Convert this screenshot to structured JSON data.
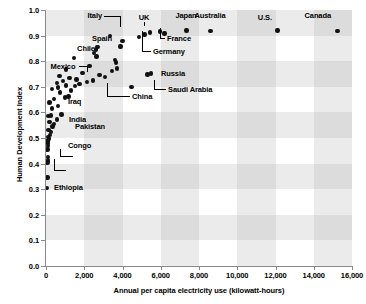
{
  "chart_data": {
    "type": "scatter",
    "title": "",
    "xlabel": "Annual per capita electricity use (kilowatt-hours)",
    "ylabel": "Human Development Index",
    "xlim": [
      0,
      16000
    ],
    "ylim": [
      0.0,
      1.0
    ],
    "xticks": [
      0,
      2000,
      4000,
      6000,
      8000,
      10000,
      12000,
      14000,
      16000
    ],
    "xtick_labels": [
      "0",
      "2,000",
      "4,000",
      "6,000",
      "8,000",
      "10,000",
      "12,000",
      "14,000",
      "16,000"
    ],
    "yticks": [
      0.0,
      0.1,
      0.2,
      0.3,
      0.4,
      0.5,
      0.6,
      0.7,
      0.8,
      0.9,
      1.0
    ],
    "ytick_labels": [
      "0.0",
      "0.1",
      "0.2",
      "0.3",
      "0.4",
      "0.5",
      "0.6",
      "0.7",
      "0.8",
      "0.9",
      "1.0"
    ],
    "grid": "checkerboard-bands",
    "legend": "none",
    "marker_color": "#111111",
    "band_color": "#e8e8e8",
    "points": [
      {
        "x": 60,
        "y": 0.305
      },
      {
        "x": 70,
        "y": 0.345
      },
      {
        "x": 75,
        "y": 0.405
      },
      {
        "x": 90,
        "y": 0.412
      },
      {
        "x": 100,
        "y": 0.425
      },
      {
        "x": 80,
        "y": 0.455
      },
      {
        "x": 95,
        "y": 0.468
      },
      {
        "x": 110,
        "y": 0.478
      },
      {
        "x": 70,
        "y": 0.487
      },
      {
        "x": 120,
        "y": 0.492
      },
      {
        "x": 150,
        "y": 0.498
      },
      {
        "x": 90,
        "y": 0.505
      },
      {
        "x": 200,
        "y": 0.512
      },
      {
        "x": 260,
        "y": 0.523
      },
      {
        "x": 140,
        "y": 0.532
      },
      {
        "x": 330,
        "y": 0.545
      },
      {
        "x": 420,
        "y": 0.555
      },
      {
        "x": 190,
        "y": 0.562
      },
      {
        "x": 560,
        "y": 0.572
      },
      {
        "x": 130,
        "y": 0.585
      },
      {
        "x": 260,
        "y": 0.588
      },
      {
        "x": 820,
        "y": 0.592
      },
      {
        "x": 310,
        "y": 0.615
      },
      {
        "x": 640,
        "y": 0.625
      },
      {
        "x": 180,
        "y": 0.638
      },
      {
        "x": 420,
        "y": 0.652
      },
      {
        "x": 980,
        "y": 0.658
      },
      {
        "x": 1180,
        "y": 0.662
      },
      {
        "x": 740,
        "y": 0.678
      },
      {
        "x": 1320,
        "y": 0.685
      },
      {
        "x": 300,
        "y": 0.692
      },
      {
        "x": 640,
        "y": 0.698
      },
      {
        "x": 1500,
        "y": 0.702
      },
      {
        "x": 1040,
        "y": 0.705
      },
      {
        "x": 1760,
        "y": 0.712
      },
      {
        "x": 560,
        "y": 0.715
      },
      {
        "x": 2150,
        "y": 0.718
      },
      {
        "x": 880,
        "y": 0.722
      },
      {
        "x": 2460,
        "y": 0.725
      },
      {
        "x": 1600,
        "y": 0.728
      },
      {
        "x": 4480,
        "y": 0.7
      },
      {
        "x": 1220,
        "y": 0.735
      },
      {
        "x": 3100,
        "y": 0.738
      },
      {
        "x": 700,
        "y": 0.742
      },
      {
        "x": 2800,
        "y": 0.745
      },
      {
        "x": 5300,
        "y": 0.748
      },
      {
        "x": 5500,
        "y": 0.752
      },
      {
        "x": 1900,
        "y": 0.755
      },
      {
        "x": 3450,
        "y": 0.762
      },
      {
        "x": 1050,
        "y": 0.768
      },
      {
        "x": 3700,
        "y": 0.772
      },
      {
        "x": 2280,
        "y": 0.782
      },
      {
        "x": 3660,
        "y": 0.795
      },
      {
        "x": 3620,
        "y": 0.805
      },
      {
        "x": 1450,
        "y": 0.812
      },
      {
        "x": 2650,
        "y": 0.818
      },
      {
        "x": 2500,
        "y": 0.832
      },
      {
        "x": 2620,
        "y": 0.845
      },
      {
        "x": 2700,
        "y": 0.855
      },
      {
        "x": 3900,
        "y": 0.858
      },
      {
        "x": 4000,
        "y": 0.878
      },
      {
        "x": 4850,
        "y": 0.895
      },
      {
        "x": 3360,
        "y": 0.898
      },
      {
        "x": 5150,
        "y": 0.905
      },
      {
        "x": 5450,
        "y": 0.912
      },
      {
        "x": 5950,
        "y": 0.916
      },
      {
        "x": 6200,
        "y": 0.908
      },
      {
        "x": 7350,
        "y": 0.92
      },
      {
        "x": 8600,
        "y": 0.918
      },
      {
        "x": 12100,
        "y": 0.92
      },
      {
        "x": 15250,
        "y": 0.918
      }
    ],
    "annotations": [
      {
        "label": "Italy",
        "point": {
          "x": 4000,
          "y": 0.878
        }
      },
      {
        "label": "UK",
        "point": {
          "x": 5450,
          "y": 0.912
        }
      },
      {
        "label": "Japan",
        "point": {
          "x": 7350,
          "y": 0.92
        }
      },
      {
        "label": "Australia",
        "point": {
          "x": 8600,
          "y": 0.918
        }
      },
      {
        "label": "U.S.",
        "point": {
          "x": 12100,
          "y": 0.92
        }
      },
      {
        "label": "Canada",
        "point": {
          "x": 15250,
          "y": 0.918
        }
      },
      {
        "label": "France",
        "point": {
          "x": 5950,
          "y": 0.916
        }
      },
      {
        "label": "Germany",
        "point": {
          "x": 6200,
          "y": 0.908
        }
      },
      {
        "label": "Spain",
        "point": {
          "x": 3360,
          "y": 0.898
        }
      },
      {
        "label": "Chile",
        "point": {
          "x": 2700,
          "y": 0.855
        }
      },
      {
        "label": "Mexico",
        "point": {
          "x": 1450,
          "y": 0.812
        }
      },
      {
        "label": "Russia",
        "point": {
          "x": 5300,
          "y": 0.748
        }
      },
      {
        "label": "Saudi Arabia",
        "point": {
          "x": 5500,
          "y": 0.752
        }
      },
      {
        "label": "China",
        "point": {
          "x": 1760,
          "y": 0.712
        }
      },
      {
        "label": "Iraq",
        "point": {
          "x": 980,
          "y": 0.658
        }
      },
      {
        "label": "India",
        "point": {
          "x": 560,
          "y": 0.572
        }
      },
      {
        "label": "Pakistan",
        "point": {
          "x": 420,
          "y": 0.555
        }
      },
      {
        "label": "Congo",
        "point": {
          "x": 95,
          "y": 0.468
        }
      },
      {
        "label": "Ethiopia",
        "point": {
          "x": 60,
          "y": 0.305
        }
      }
    ]
  },
  "labels": {
    "italy": "Italy",
    "uk": "UK",
    "japan": "Japan",
    "australia": "Australia",
    "us": "U.S.",
    "canada": "Canada",
    "france": "France",
    "germany": "Germany",
    "spain": "Spain",
    "chile": "Chile",
    "mexico": "Mexico",
    "russia": "Russia",
    "saudi_arabia": "Saudi Arabia",
    "china": "China",
    "iraq": "Iraq",
    "india": "India",
    "pakistan": "Pakistan",
    "congo": "Congo",
    "ethiopia": "Ethiopia"
  }
}
